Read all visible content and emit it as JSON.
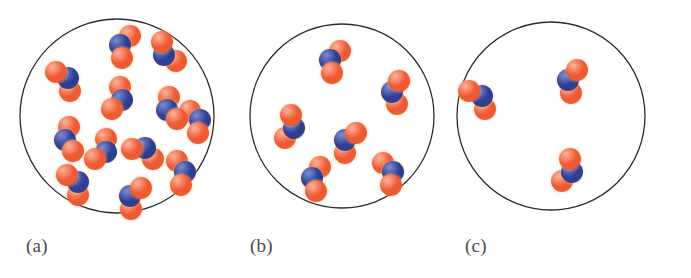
{
  "figure": {
    "background_color": "#ffffff",
    "vessel_outline_color": "#2b2b2b",
    "vessel_outline_width": 1.3,
    "label_color": "#4a4a4a"
  },
  "molecule_model": {
    "name": "nitrogen-dioxide",
    "formula": "NO2",
    "atoms": [
      {
        "element": "N",
        "role": "center",
        "color": "#2d3f93",
        "highlight_color": "#7d8ad4",
        "radius": 11
      },
      {
        "element": "O",
        "role": "terminal",
        "color": "#ef5a33",
        "highlight_color": "#ffb39a",
        "radius": 11
      },
      {
        "element": "O",
        "role": "terminal",
        "color": "#ef5a33",
        "highlight_color": "#ffb39a",
        "radius": 11
      }
    ],
    "rim_glow_color": "#f5c77a"
  },
  "panels": [
    {
      "id": "a",
      "label": "(a)",
      "label_x": 26,
      "label_y": 235,
      "circle": {
        "cx": 117,
        "cy": 116,
        "r": 97
      },
      "molecule_count": 14,
      "molecules": [
        {
          "x": 120,
          "y": 45,
          "rot": 20
        },
        {
          "x": 164,
          "y": 55,
          "rot": -35
        },
        {
          "x": 68,
          "y": 78,
          "rot": 145
        },
        {
          "x": 122,
          "y": 100,
          "rot": 200
        },
        {
          "x": 167,
          "y": 110,
          "rot": -20
        },
        {
          "x": 200,
          "y": 120,
          "rot": 160
        },
        {
          "x": 65,
          "y": 140,
          "rot": -10
        },
        {
          "x": 106,
          "y": 152,
          "rot": 210
        },
        {
          "x": 145,
          "y": 148,
          "rot": 115
        },
        {
          "x": 185,
          "y": 172,
          "rot": 170
        },
        {
          "x": 78,
          "y": 182,
          "rot": 150
        },
        {
          "x": 130,
          "y": 196,
          "rot": 25
        }
      ]
    },
    {
      "id": "b",
      "label": "(b)",
      "label_x": 250,
      "label_y": 235,
      "circle": {
        "cx": 342,
        "cy": 116,
        "r": 92
      },
      "molecule_count": 6,
      "molecules": [
        {
          "x": 330,
          "y": 60,
          "rot": 20
        },
        {
          "x": 392,
          "y": 92,
          "rot": 5
        },
        {
          "x": 294,
          "y": 128,
          "rot": 195
        },
        {
          "x": 345,
          "y": 140,
          "rot": 30
        },
        {
          "x": 312,
          "y": 178,
          "rot": 10
        },
        {
          "x": 393,
          "y": 172,
          "rot": 160
        }
      ]
    },
    {
      "id": "c",
      "label": "(c)",
      "label_x": 465,
      "label_y": 235,
      "circle": {
        "cx": 551,
        "cy": 116,
        "r": 94
      },
      "molecule_count": 3,
      "molecules": [
        {
          "x": 482,
          "y": 96,
          "rot": 140
        },
        {
          "x": 568,
          "y": 80,
          "rot": 15
        },
        {
          "x": 572,
          "y": 172,
          "rot": 200
        }
      ]
    }
  ]
}
